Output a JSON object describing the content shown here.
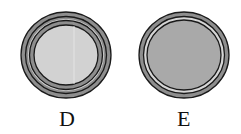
{
  "figures": [
    {
      "label": "D",
      "center": [
        66,
        55
      ],
      "radius": [
        45,
        43
      ],
      "rings": "two gray rings between three dark outlines",
      "interior_color": "#d2d2d2",
      "ring_color": "#8e8e8e",
      "line_color": "#1a1a1a"
    },
    {
      "label": "E",
      "center": [
        184,
        55
      ],
      "radius": [
        45,
        43
      ],
      "rings": "outer gray ring, light ring, dark outlines",
      "interior_color": "#a9a9a9",
      "ring_color": "#8e8e8e",
      "light_ring_color": "#d6d6d6",
      "line_color": "#1a1a1a"
    }
  ]
}
